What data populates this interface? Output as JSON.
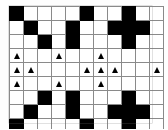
{
  "figure": {
    "name": "lattice-pattern-diagram",
    "colors": {
      "filled_cell": "#000000",
      "empty_cell": "#ffffff",
      "grid_line": "#8a8a8a",
      "marker": "#000000",
      "background": "#ffffff"
    }
  },
  "chart_data": {
    "type": "heatmap",
    "title": "",
    "xlabel": "",
    "ylabel": "",
    "columns": 11,
    "rows": 9,
    "legend": [
      {
        "symbol": "filled-square",
        "label": "filled"
      },
      {
        "symbol": "empty-square",
        "label": "empty"
      },
      {
        "symbol": "triangle-marker",
        "label": "marker"
      }
    ],
    "cell_codes": {
      "0": "empty",
      "1": "filled",
      "2": "empty-with-triangle-marker"
    },
    "cells": [
      [
        1,
        0,
        0,
        0,
        0,
        1,
        0,
        0,
        1,
        0,
        0
      ],
      [
        0,
        1,
        0,
        0,
        1,
        0,
        0,
        1,
        1,
        1,
        0
      ],
      [
        0,
        0,
        1,
        0,
        1,
        0,
        0,
        0,
        1,
        0,
        0
      ],
      [
        2,
        0,
        0,
        2,
        0,
        0,
        2,
        0,
        0,
        0,
        0
      ],
      [
        2,
        2,
        0,
        0,
        0,
        2,
        2,
        2,
        0,
        0,
        2
      ],
      [
        2,
        0,
        0,
        2,
        0,
        0,
        2,
        0,
        0,
        0,
        0
      ],
      [
        0,
        0,
        1,
        0,
        1,
        0,
        0,
        0,
        1,
        0,
        0
      ],
      [
        0,
        1,
        0,
        0,
        1,
        0,
        0,
        1,
        1,
        1,
        0
      ],
      [
        1,
        0,
        0,
        0,
        0,
        1,
        0,
        0,
        1,
        0,
        0
      ]
    ],
    "filled_counts_per_row": [
      3,
      5,
      3,
      0,
      0,
      0,
      3,
      5,
      3
    ],
    "marker_counts_per_row": [
      0,
      0,
      0,
      3,
      6,
      3,
      0,
      0,
      0
    ],
    "total_filled": 22,
    "total_markers": 12,
    "symmetry": "vertical mirror about row 5"
  }
}
